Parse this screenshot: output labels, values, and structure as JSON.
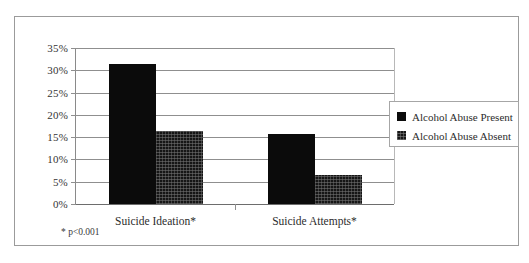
{
  "chart_data": {
    "type": "bar",
    "title": "",
    "xlabel": "",
    "ylabel": "",
    "categories": [
      "Suicide Ideation*",
      "Suicide Attempts*"
    ],
    "series": [
      {
        "name": "Alcohol Abuse Present",
        "values": [
          31.5,
          15.7
        ]
      },
      {
        "name": "Alcohol Abuse Absent",
        "values": [
          16.3,
          6.6
        ]
      }
    ],
    "ylim": [
      0,
      35
    ],
    "ytick_values": [
      0,
      5,
      10,
      15,
      20,
      25,
      30,
      35
    ],
    "ytick_labels": [
      "0%",
      "5%",
      "10%",
      "15%",
      "20%",
      "25%",
      "30%",
      "35%"
    ],
    "grid": true,
    "legend_position": "right",
    "annotation": "* p<0.001",
    "colors": {
      "series_present": "#0b0b0b",
      "series_absent": "#161616",
      "gridline": "#8f8f8f",
      "frame": "#9b9b9b",
      "text": "#2c2c2c"
    }
  },
  "legend": {
    "items": [
      {
        "label": "Alcohol Abuse Present"
      },
      {
        "label": "Alcohol Abuse Absent"
      }
    ]
  },
  "footnote": {
    "text": "* p<0.001"
  }
}
